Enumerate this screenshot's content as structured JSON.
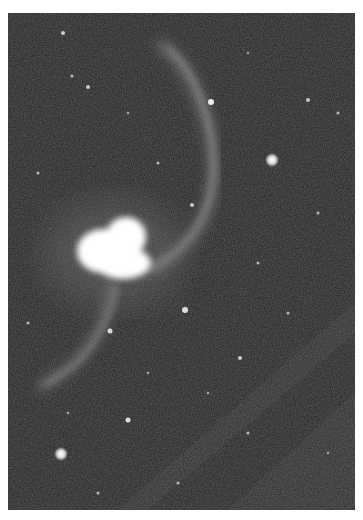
{
  "image": {
    "subject": "interacting galaxies with long tidal tails",
    "colors": {
      "background": "#2e2e2e",
      "sky_noise_light": "#4a4a4a",
      "tail": "#8a8a8a",
      "core": "#ffffff",
      "page": "#ffffff"
    },
    "frame": {
      "x": 8,
      "y": 13,
      "width": 347,
      "height": 497
    },
    "bright_stars": [
      {
        "x": 272,
        "y": 160,
        "r": 5
      },
      {
        "x": 61,
        "y": 454,
        "r": 5
      },
      {
        "x": 211,
        "y": 102,
        "r": 3
      },
      {
        "x": 185,
        "y": 310,
        "r": 3
      },
      {
        "x": 110,
        "y": 331,
        "r": 2.5
      }
    ]
  }
}
